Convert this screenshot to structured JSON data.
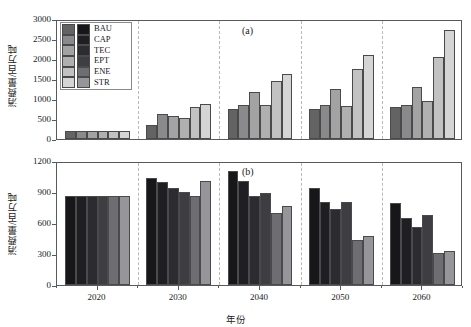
{
  "chart_data": [
    {
      "type": "bar",
      "panel": "(a)",
      "title": "",
      "xlabel": "年份",
      "ylabel": "消费量/百万吨",
      "categories": [
        "2020",
        "2030",
        "2040",
        "2050",
        "2060"
      ],
      "ylim": [
        0,
        3000
      ],
      "yticks": [
        0,
        500,
        1000,
        1500,
        2000,
        2500,
        3000
      ],
      "grid": false,
      "legend_position": "upper-left",
      "series": [
        {
          "name": "BAU",
          "color": "#636364",
          "values": [
            210,
            360,
            755,
            760,
            790
          ]
        },
        {
          "name": "CAP",
          "color": "#8a8a8c",
          "values": [
            210,
            620,
            860,
            840,
            860
          ]
        },
        {
          "name": "TEC",
          "color": "#a3a3a4",
          "values": [
            210,
            570,
            1180,
            1250,
            1300
          ]
        },
        {
          "name": "EPT",
          "color": "#b0b0b1",
          "values": [
            210,
            520,
            850,
            830,
            940
          ]
        },
        {
          "name": "ENE",
          "color": "#c2c2c3",
          "values": [
            210,
            790,
            1440,
            1760,
            2050
          ]
        },
        {
          "name": "STR",
          "color": "#d5d5d6",
          "values": [
            210,
            880,
            1620,
            2100,
            2720
          ]
        }
      ]
    },
    {
      "type": "bar",
      "panel": "(b)",
      "title": "",
      "xlabel": "年份",
      "ylabel": "消费量/百万吨",
      "categories": [
        "2020",
        "2030",
        "2040",
        "2050",
        "2060"
      ],
      "ylim": [
        0,
        1200
      ],
      "yticks": [
        0,
        300,
        600,
        900,
        1200
      ],
      "grid": false,
      "legend_position": "none",
      "series": [
        {
          "name": "BAU",
          "color": "#17171a",
          "values": [
            860,
            1040,
            1100,
            940,
            790
          ]
        },
        {
          "name": "CAP",
          "color": "#1f1f23",
          "values": [
            860,
            1000,
            1010,
            800,
            650
          ]
        },
        {
          "name": "TEC",
          "color": "#2b2b30",
          "values": [
            860,
            940,
            860,
            740,
            560
          ]
        },
        {
          "name": "EPT",
          "color": "#3d3d42",
          "values": [
            860,
            900,
            890,
            800,
            680
          ]
        },
        {
          "name": "ENE",
          "color": "#6e6e72",
          "values": [
            860,
            860,
            700,
            440,
            310
          ]
        },
        {
          "name": "STR",
          "color": "#96969a",
          "values": [
            860,
            1010,
            760,
            470,
            330
          ]
        }
      ]
    }
  ],
  "legend": {
    "entries": [
      "BAU",
      "CAP",
      "TEC",
      "EPT",
      "ENE",
      "STR"
    ]
  },
  "axes": {
    "panel_a": {
      "tag": "(a)",
      "ylabel": "消费量/百万吨",
      "yticks": [
        "3000",
        "2500",
        "2000",
        "1500",
        "1000",
        "500",
        "0"
      ]
    },
    "panel_b": {
      "tag": "(b)",
      "ylabel": "消费量/百万吨",
      "yticks": [
        "1200",
        "900",
        "600",
        "300",
        "0"
      ]
    },
    "xlabel": "年份",
    "xticks": [
      "2020",
      "2030",
      "2040",
      "2050",
      "2060"
    ]
  }
}
